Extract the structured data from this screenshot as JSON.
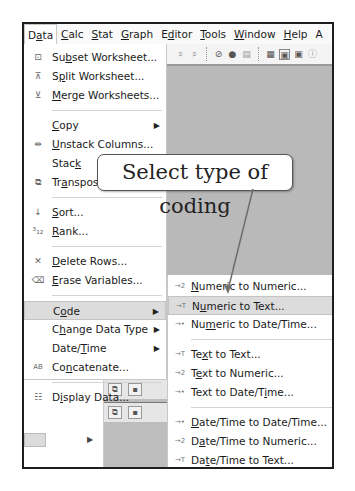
{
  "menubar": {
    "items": [
      {
        "label": "Data",
        "underline_index": 1,
        "active": true
      },
      {
        "label": "Calc",
        "underline_index": 0
      },
      {
        "label": "Stat",
        "underline_index": 0
      },
      {
        "label": "Graph",
        "underline_index": 0
      },
      {
        "label": "Editor",
        "underline_index": 1
      },
      {
        "label": "Tools",
        "underline_index": 0
      },
      {
        "label": "Window",
        "underline_index": 0
      },
      {
        "label": "Help",
        "underline_index": 0
      },
      {
        "label": "A"
      }
    ]
  },
  "toolbar": {
    "icons": [
      "find-icon",
      "find-replace-icon",
      "cancel-icon",
      "help-icon",
      "document-icon",
      "worksheet-icon",
      "session-window-icon",
      "project-manager-icon",
      "info-icon"
    ]
  },
  "data_menu": {
    "items": [
      {
        "label": "Subset Worksheet...",
        "icon": "subset-worksheet-icon",
        "glyph": "⊡"
      },
      {
        "label": "Split Worksheet...",
        "icon": "split-worksheet-icon",
        "glyph": "⊼"
      },
      {
        "label": "Merge Worksheets...",
        "icon": "merge-worksheets-icon",
        "glyph": "⊻"
      },
      {
        "separator": true
      },
      {
        "label": "Copy",
        "submenu": true
      },
      {
        "label": "Unstack Columns...",
        "icon": "unstack-columns-icon",
        "glyph": "⇹"
      },
      {
        "label": "Stack",
        "submenu": true
      },
      {
        "label": "Transpose Columns...",
        "icon": "transpose-icon",
        "glyph": "⧉"
      },
      {
        "separator": true
      },
      {
        "label": "Sort...",
        "icon": "sort-icon",
        "glyph": "↓"
      },
      {
        "label": "Rank...",
        "icon": "rank-icon",
        "glyph": "³₁₂"
      },
      {
        "separator": true
      },
      {
        "label": "Delete Rows...",
        "icon": "delete-rows-icon",
        "glyph": "✕"
      },
      {
        "label": "Erase Variables...",
        "icon": "erase-variables-icon",
        "glyph": "⌫"
      },
      {
        "separator": true
      },
      {
        "label": "Code",
        "submenu": true,
        "highlight": true
      },
      {
        "label": "Change Data Type",
        "submenu": true
      },
      {
        "label": "Date/Time",
        "submenu": true
      },
      {
        "label": "Concatenate...",
        "icon": "concatenate-icon",
        "glyph": "AB"
      },
      {
        "separator": true
      },
      {
        "label": "Display Data...",
        "icon": "display-data-icon",
        "glyph": "☷"
      }
    ]
  },
  "code_submenu": {
    "items": [
      {
        "label": "Numeric to Numeric...",
        "glyph": "→2"
      },
      {
        "label": "Numeric to Text...",
        "glyph": "→T",
        "highlight": true
      },
      {
        "label": "Numeric to Date/Time...",
        "glyph": "→•"
      },
      {
        "separator": true
      },
      {
        "label": "Text to Text...",
        "glyph": "→T"
      },
      {
        "label": "Text to Numeric...",
        "glyph": "→2"
      },
      {
        "label": "Text to Date/Time...",
        "glyph": "→•"
      },
      {
        "separator": true
      },
      {
        "label": "Date/Time to Date/Time...",
        "glyph": "→•"
      },
      {
        "label": "Date/Time to Numeric...",
        "glyph": "→2"
      },
      {
        "label": "Date/Time to Text...",
        "glyph": "→T"
      },
      {
        "separator": true
      },
      {
        "label": "Use Conversion Table...",
        "glyph": ""
      }
    ]
  },
  "callout": {
    "text": "Select type of coding"
  },
  "colors": {
    "frame_border": "#1e1e1e",
    "workspace_gray": "#b9b9b9",
    "highlight": "#dcdcdc",
    "pointer_line": "#6e6e6e"
  }
}
